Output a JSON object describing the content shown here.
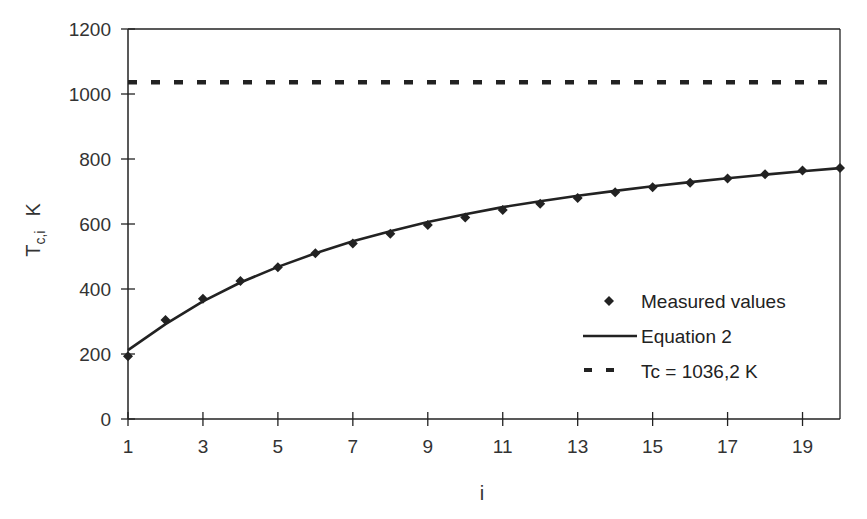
{
  "chart_data": {
    "type": "line",
    "title": "",
    "xlabel": "i",
    "ylabel": "T_c,i  K",
    "ylabel_main": "T",
    "ylabel_sub": "c,i",
    "ylabel_unit": "K",
    "xlim": [
      1,
      20
    ],
    "ylim": [
      0,
      1200
    ],
    "x_ticks": [
      1,
      3,
      5,
      7,
      9,
      11,
      13,
      15,
      17,
      19
    ],
    "y_ticks": [
      0,
      200,
      400,
      600,
      800,
      1000,
      1200
    ],
    "grid": false,
    "legend_position": "lower right inside",
    "x": [
      1,
      2,
      3,
      4,
      5,
      6,
      7,
      8,
      9,
      10,
      11,
      12,
      13,
      14,
      15,
      16,
      17,
      18,
      19,
      20
    ],
    "series": [
      {
        "name": "Measured values",
        "style": "marker-diamond",
        "values": [
          193,
          305,
          370,
          425,
          467,
          510,
          540,
          570,
          597,
          620,
          643,
          662,
          680,
          698,
          713,
          727,
          740,
          753,
          765,
          772
        ]
      },
      {
        "name": "Equation 2",
        "style": "solid-line",
        "values": [
          212,
          292,
          362,
          420,
          468,
          510,
          547,
          578,
          606,
          630,
          652,
          670,
          687,
          702,
          716,
          729,
          741,
          752,
          762,
          772
        ]
      },
      {
        "name": "Tc = 1036,2 K",
        "style": "dashed-line",
        "values": [
          1036.2,
          1036.2,
          1036.2,
          1036.2,
          1036.2,
          1036.2,
          1036.2,
          1036.2,
          1036.2,
          1036.2,
          1036.2,
          1036.2,
          1036.2,
          1036.2,
          1036.2,
          1036.2,
          1036.2,
          1036.2,
          1036.2,
          1036.2
        ]
      }
    ],
    "colors": {
      "axis": "#222222",
      "series": "#222222",
      "text": "#333333"
    }
  },
  "legend": {
    "items": [
      {
        "label": "Measured values"
      },
      {
        "label": "Equation 2"
      },
      {
        "label": "Tc = 1036,2 K"
      }
    ]
  }
}
